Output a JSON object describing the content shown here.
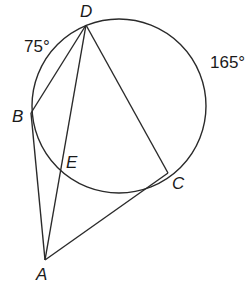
{
  "diagram": {
    "type": "circle-geometry",
    "circle": {
      "cx": 119,
      "cy": 106,
      "r": 87
    },
    "points": {
      "D": {
        "label": "D",
        "x": 86,
        "y": 25,
        "lx": 80,
        "ly": 17
      },
      "B": {
        "label": "B",
        "x": 31,
        "y": 113,
        "lx": 12,
        "ly": 122
      },
      "E": {
        "label": "E",
        "x": 61,
        "y": 170,
        "lx": 66,
        "ly": 168
      },
      "C": {
        "label": "C",
        "x": 168,
        "y": 173,
        "lx": 172,
        "ly": 189
      },
      "A": {
        "label": "A",
        "x": 45,
        "y": 260,
        "lx": 36,
        "ly": 280
      }
    },
    "segments": [
      [
        "D",
        "B"
      ],
      [
        "D",
        "E"
      ],
      [
        "E",
        "A"
      ],
      [
        "D",
        "C"
      ],
      [
        "B",
        "A"
      ],
      [
        "A",
        "C"
      ]
    ],
    "arc_labels": {
      "arc_BD": {
        "text": "75°",
        "x": 24,
        "y": 52
      },
      "arc_DC": {
        "text": "165°",
        "x": 210,
        "y": 68
      }
    }
  }
}
